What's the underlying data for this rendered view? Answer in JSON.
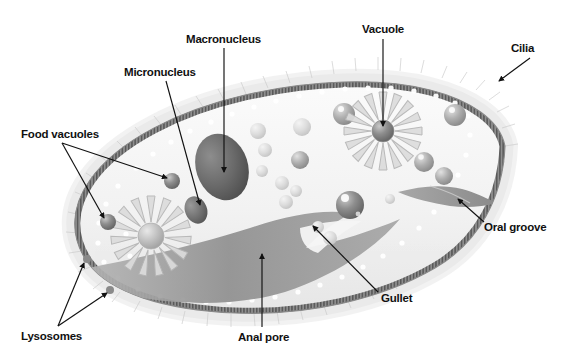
{
  "figure": {
    "background_color": "#ffffff",
    "label_color": "#111111",
    "cytoplasm_color": "#f2f2f2",
    "membrane_color": "#9a9a9a",
    "pellicle_color": "#6e6e6e",
    "organelle_dark": "#5c5c5c",
    "organelle_mid": "#9e9e9e",
    "organelle_light": "#d9d9d9",
    "gullet_color": "#9b9b9b",
    "leader_color": "#1a1a1a"
  },
  "labels": [
    {
      "id": "macronucleus",
      "text": "Macronucleus",
      "x": 186,
      "y": 33
    },
    {
      "id": "micronucleus",
      "text": "Micronucleus",
      "x": 124,
      "y": 66
    },
    {
      "id": "vacuole",
      "text": "Vacuole",
      "x": 362,
      "y": 23
    },
    {
      "id": "cilia",
      "text": "Cilia",
      "x": 511,
      "y": 42
    },
    {
      "id": "food-vacuoles",
      "text": "Food vacuoles",
      "x": 21,
      "y": 128
    },
    {
      "id": "oral-groove",
      "text": "Oral groove",
      "x": 484,
      "y": 221
    },
    {
      "id": "gullet",
      "text": "Gullet",
      "x": 381,
      "y": 292
    },
    {
      "id": "anal-pore",
      "text": "Anal pore",
      "x": 238,
      "y": 331
    },
    {
      "id": "lysosomes",
      "text": "Lysosomes",
      "x": 21,
      "y": 330
    }
  ],
  "organelles": {
    "macronucleus": {
      "cx": 222,
      "cy": 167,
      "rx": 26,
      "ry": 34,
      "rotate": -18
    },
    "micronucleus": {
      "cx": 196,
      "cy": 210,
      "rx": 11,
      "ry": 14,
      "rotate": -22
    },
    "contractile_vacuole_left": {
      "cx": 151,
      "cy": 236,
      "spokes": 15,
      "r_outer": 40,
      "r_core": 13
    },
    "contractile_vacuole_right": {
      "cx": 383,
      "cy": 131,
      "spokes": 16,
      "r_outer": 39,
      "r_core": 11
    },
    "food_vacuole_arrow_targets": [
      {
        "x": 172,
        "y": 181
      },
      {
        "x": 108,
        "y": 222
      }
    ],
    "lysosome_arrow_targets": [
      {
        "x": 87,
        "y": 259
      },
      {
        "x": 110,
        "y": 290
      }
    ]
  },
  "vesicles": [
    {
      "cx": 344,
      "cy": 114,
      "r": 11,
      "tone": "mid"
    },
    {
      "cx": 302,
      "cy": 127,
      "r": 9,
      "tone": "light"
    },
    {
      "cx": 455,
      "cy": 115,
      "r": 11,
      "tone": "mid"
    },
    {
      "cx": 424,
      "cy": 162,
      "r": 10,
      "tone": "mid"
    },
    {
      "cx": 444,
      "cy": 176,
      "r": 9,
      "tone": "mid"
    },
    {
      "cx": 300,
      "cy": 160,
      "r": 9,
      "tone": "mid"
    },
    {
      "cx": 282,
      "cy": 183,
      "r": 7,
      "tone": "light"
    },
    {
      "cx": 296,
      "cy": 191,
      "r": 6,
      "tone": "light"
    },
    {
      "cx": 286,
      "cy": 202,
      "r": 7,
      "tone": "light"
    },
    {
      "cx": 350,
      "cy": 205,
      "r": 14,
      "tone": "dark"
    },
    {
      "cx": 265,
      "cy": 150,
      "r": 7,
      "tone": "light"
    },
    {
      "cx": 262,
      "cy": 171,
      "r": 6,
      "tone": "light"
    },
    {
      "cx": 258,
      "cy": 131,
      "r": 8,
      "tone": "light"
    },
    {
      "cx": 390,
      "cy": 199,
      "r": 5,
      "tone": "light"
    },
    {
      "cx": 318,
      "cy": 227,
      "r": 6,
      "tone": "light"
    },
    {
      "cx": 330,
      "cy": 238,
      "r": 7,
      "tone": "light"
    }
  ],
  "pellicle": {
    "dot_color": "#ffffff",
    "stripe_count": 150
  }
}
